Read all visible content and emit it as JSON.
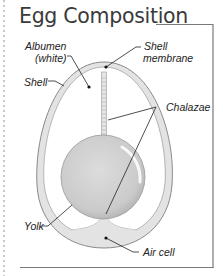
{
  "title": "Egg Composition",
  "labels": {
    "albumen": "Albumen",
    "albumen_sub": "(white)",
    "shell": "Shell",
    "shell_membrane_1": "Shell",
    "shell_membrane_2": "membrane",
    "chalazae": "Chalazae",
    "yolk": "Yolk",
    "air_cell": "Air cell"
  },
  "colors": {
    "shell_fill": "#e3e3e3",
    "shell_stroke": "#8a8a8a",
    "albumen": "#ffffff",
    "yolk": "#cfcfcf",
    "frame": "#7a7a7a"
  }
}
